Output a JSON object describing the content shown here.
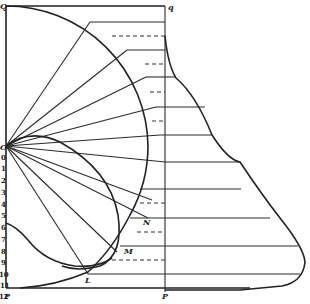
{
  "figure": {
    "point_labels": {
      "Q": "Q",
      "q": "q",
      "O": "O",
      "P_left": "P",
      "p_right": "P",
      "L": "L",
      "M": "M",
      "N": "N"
    },
    "axis": {
      "title": "Candelas",
      "ticks": [
        "0",
        "1",
        "2",
        "3",
        "4",
        "5",
        "6",
        "7",
        "8",
        "9",
        "10",
        "11",
        "12"
      ]
    },
    "colors": {
      "ink": "#222222",
      "background": "#ffffff"
    }
  }
}
